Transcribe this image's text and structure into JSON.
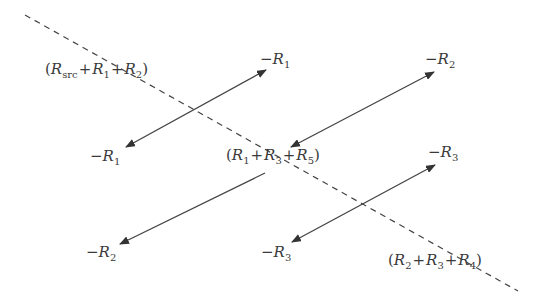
{
  "diagram": {
    "type": "signal-flow-graph",
    "line_color": "#444444",
    "dashed_line": {
      "from": [
        25,
        15
      ],
      "to": [
        518,
        291
      ]
    },
    "nodes": [
      {
        "id": "n1",
        "label": "(R_src + R_1 + R_2)",
        "parts": [
          "(",
          "R",
          "src",
          "+",
          "R",
          "1",
          "+",
          "R",
          "2",
          ")"
        ],
        "x": 45,
        "y": 62
      },
      {
        "id": "n2",
        "label": "(R_1 + R_3 + R_5)",
        "parts": [
          "(",
          "R",
          "1",
          "+",
          "R",
          "3",
          "+",
          "R",
          "5",
          ")"
        ],
        "x": 226,
        "y": 148
      },
      {
        "id": "n3",
        "label": "(R_2 + R_3 + R_4)",
        "parts": [
          "(",
          "R",
          "2",
          "+",
          "R",
          "3",
          "+",
          "R",
          "4",
          ")"
        ],
        "x": 388,
        "y": 253
      }
    ],
    "edge_labels": [
      {
        "id": "e1",
        "text": "−R",
        "sub": "1",
        "x": 260,
        "y": 52
      },
      {
        "id": "e2",
        "text": "−R",
        "sub": "1",
        "x": 90,
        "y": 149
      },
      {
        "id": "e3",
        "text": "−R",
        "sub": "2",
        "x": 425,
        "y": 52
      },
      {
        "id": "e4",
        "text": "−R",
        "sub": "3",
        "x": 428,
        "y": 145
      },
      {
        "id": "e5",
        "text": "−R",
        "sub": "2",
        "x": 86,
        "y": 245
      },
      {
        "id": "e6",
        "text": "−R",
        "sub": "3",
        "x": 261,
        "y": 245
      }
    ],
    "arrows": [
      {
        "id": "a1",
        "from": [
          126,
          147
        ],
        "to": [
          266,
          70
        ],
        "heads": "both"
      },
      {
        "id": "a2",
        "from": [
          265,
          173
        ],
        "to": [
          120,
          244
        ],
        "heads": "end"
      },
      {
        "id": "a3",
        "from": [
          291,
          147
        ],
        "to": [
          434,
          72
        ],
        "heads": "both"
      },
      {
        "id": "a4",
        "from": [
          292,
          242
        ],
        "to": [
          435,
          165
        ],
        "heads": "both"
      }
    ]
  }
}
